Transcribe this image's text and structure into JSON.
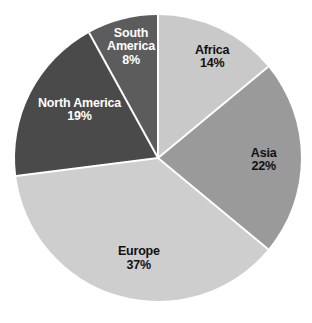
{
  "chart_data": {
    "type": "pie",
    "title": "",
    "subtitle": "",
    "xlabel": "",
    "ylabel": "",
    "legend": "none",
    "grid": false,
    "units": "percent",
    "total": 100,
    "background_color": "#ffffff",
    "separator_color": "#ffffff",
    "start_angle_deg": 0,
    "direction": "clockwise",
    "categories": [
      "Africa",
      "Asia",
      "Europe",
      "North America",
      "South America"
    ],
    "values": [
      14,
      22,
      37,
      19,
      8
    ],
    "slices": [
      {
        "label": "Africa",
        "value": 14,
        "value_text": "14%",
        "color": "#c9c9c9",
        "label_color": "#111111",
        "label_style": "dark",
        "label_lines": [
          "Africa",
          "14%"
        ],
        "label_x_pct": 68.0,
        "label_y_pct": 17.5
      },
      {
        "label": "Asia",
        "value": 22,
        "value_text": "22%",
        "color": "#9a9a9a",
        "label_color": "#111111",
        "label_style": "dark",
        "label_lines": [
          "Asia",
          "22%"
        ],
        "label_x_pct": 84.5,
        "label_y_pct": 49.5
      },
      {
        "label": "Europe",
        "value": 37,
        "value_text": "37%",
        "color": "#cecece",
        "label_color": "#111111",
        "label_style": "dark",
        "label_lines": [
          "Europe",
          "37%"
        ],
        "label_x_pct": 44.5,
        "label_y_pct": 80.0
      },
      {
        "label": "North America",
        "value": 19,
        "value_text": "19%",
        "color": "#4a4a4a",
        "label_color": "#ffffff",
        "label_style": "light",
        "label_lines": [
          "North America",
          "19%"
        ],
        "label_x_pct": 25.5,
        "label_y_pct": 34.0
      },
      {
        "label": "South America",
        "value": 8,
        "value_text": "8%",
        "color": "#5c5c5c",
        "label_color": "#ffffff",
        "label_style": "light",
        "label_lines": [
          "South",
          "America",
          "8%"
        ],
        "label_x_pct": 42.0,
        "label_y_pct": 14.5
      }
    ]
  },
  "geometry": {
    "center_x": 158,
    "center_y": 158,
    "radius": 143
  }
}
